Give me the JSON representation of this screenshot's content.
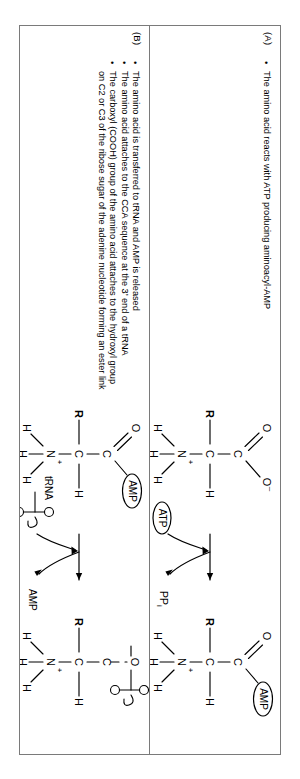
{
  "figure": {
    "panels": [
      {
        "id": "A",
        "label": "(A)",
        "bullets": [
          "The amino acid reacts with ATP producing aminoacyl-AMP"
        ],
        "reaction": {
          "reactant_labels": [
            "R",
            "C",
            "H",
            "N",
            "H",
            "H",
            "H",
            "O",
            "O⁻"
          ],
          "product_labels": [
            "R",
            "C",
            "H",
            "N",
            "H",
            "H",
            "H",
            "O"
          ],
          "reactant_bubble": "",
          "input_bubble": "ATP",
          "output_bubble": "PP",
          "output_bubble_sub": "i",
          "product_bubble": "AMP",
          "charge": "+",
          "negative": "–"
        }
      },
      {
        "id": "B",
        "label": "(B)",
        "bullets": [
          "The amino acid is transferred to tRNA and AMP is released",
          "The amino acid attaches to the CCA sequence at the 3’ end of a tRNA",
          "The carboxyl (COOH) group of the amino acid attaches to the hydroxyl group on C2 or C3 of the ribose sugar of the adenine nucleotide forming an ester link"
        ],
        "reaction": {
          "reactant_labels": [
            "R",
            "C",
            "H",
            "N",
            "H",
            "H",
            "H",
            "O"
          ],
          "product_labels": [
            "R",
            "C",
            "H",
            "N",
            "H",
            "H",
            "H",
            "O"
          ],
          "reactant_bubble": "AMP",
          "input_bubble": "tRNA",
          "output_bubble": "AMP",
          "product_bubble": "tRNA-cloverleaf",
          "charge": "+"
        }
      }
    ]
  },
  "glyphs": {
    "R": "R",
    "C": "C",
    "H": "H",
    "N": "N",
    "O": "O",
    "plus": "+",
    "minus": "–",
    "amp": "AMP",
    "atp": "ATP",
    "ppi": "PP",
    "ppi_sub": "i",
    "trna": "tRNA"
  },
  "colors": {
    "border": "#7a7a7a",
    "ink": "#000000",
    "background": "#ffffff"
  }
}
